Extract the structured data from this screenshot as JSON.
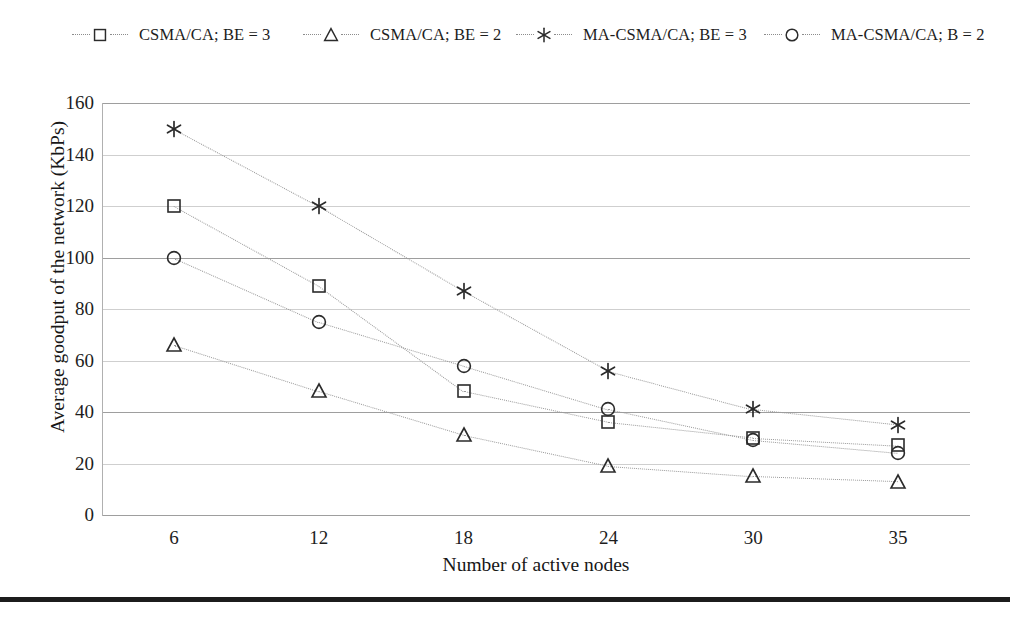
{
  "chart_data": {
    "type": "scatter",
    "title": "",
    "xlabel": "Number of active nodes",
    "ylabel": "Average goodput of the network (KbPs)",
    "categories": [
      "6",
      "12",
      "18",
      "24",
      "30",
      "35"
    ],
    "x": [
      6,
      12,
      18,
      24,
      30,
      35
    ],
    "ylim": [
      0,
      160
    ],
    "ytick_labels": [
      "0",
      "20",
      "40",
      "60",
      "80",
      "100",
      "120",
      "140",
      "160"
    ],
    "ytick_values": [
      0,
      20,
      40,
      60,
      80,
      100,
      120,
      140,
      160
    ],
    "grid": true,
    "legend_position": "top",
    "series": [
      {
        "name": "CSMA/CA; BE = 3",
        "marker": "square",
        "color": "#2b2b2b",
        "values": [
          120,
          89,
          48,
          36,
          30,
          27
        ]
      },
      {
        "name": "CSMA/CA; BE = 2",
        "marker": "triangle",
        "color": "#2b2b2b",
        "values": [
          66,
          48,
          31,
          19,
          15,
          13
        ]
      },
      {
        "name": "MA-CSMA/CA; BE = 3",
        "marker": "asterisk",
        "color": "#2b2b2b",
        "values": [
          150,
          120,
          87,
          56,
          41,
          35
        ]
      },
      {
        "name": "MA-CSMA/CA; B = 2",
        "marker": "circle",
        "color": "#2b2b2b",
        "values": [
          100,
          75,
          58,
          41,
          29,
          24
        ]
      }
    ]
  },
  "legend": {
    "items": [
      {
        "label": "CSMA/CA; BE = 3",
        "marker": "square-marker-icon",
        "x": 72
      },
      {
        "label": "CSMA/CA; BE = 2",
        "marker": "triangle-marker-icon",
        "x": 303
      },
      {
        "label": "MA-CSMA/CA; BE = 3",
        "marker": "asterisk-marker-icon",
        "x": 516
      },
      {
        "label": "MA-CSMA/CA; B = 2",
        "marker": "circle-marker-icon",
        "x": 764
      }
    ]
  },
  "colors": {
    "gridline": "#cfcfcf",
    "gridline_major": "#9e9e9e",
    "marker": "#2b2b2b",
    "connector": "#9a9a9a",
    "footer_rule": "#1c1c1c",
    "background": "#ffffff"
  }
}
